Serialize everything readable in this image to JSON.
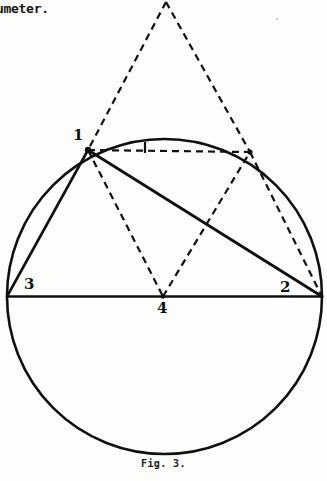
{
  "page": {
    "width": 327,
    "height": 481,
    "background_color": "#fdfdfc",
    "ink_color": "#101010",
    "body_text_fragment": "umeter."
  },
  "figure": {
    "caption": "Fig. 3.",
    "title_implied": "Fig. 3.",
    "stroke_color": "#101010",
    "solid_stroke_width": 2.6,
    "dashed_stroke_width": 2.2,
    "dash_pattern": "7,5",
    "circle": {
      "name": "main-circle",
      "cx": 164.5,
      "cy": 296.5,
      "r": 157.5,
      "style": "solid"
    },
    "diameter": {
      "name": "horizontal-diameter",
      "x1": 7,
      "y1": 296.5,
      "x2": 322,
      "y2": 296.5,
      "style": "solid"
    },
    "points": [
      {
        "id": "1",
        "label": "1",
        "x": 88,
        "y": 150,
        "label_x": 73,
        "label_y": 128
      },
      {
        "id": "2",
        "label": "2",
        "x": 322,
        "y": 296.5,
        "label_x": 280,
        "label_y": 280
      },
      {
        "id": "3",
        "label": "3",
        "x": 7,
        "y": 296.5,
        "label_x": 24,
        "label_y": 277
      },
      {
        "id": "4",
        "label": "4",
        "x": 163,
        "y": 296.5,
        "label_x": 157,
        "label_y": 301
      },
      {
        "id": "apex",
        "label": "",
        "x": 166,
        "y": 2,
        "label_x": 0,
        "label_y": 0
      },
      {
        "id": "mirror",
        "label": "",
        "x": 250,
        "y": 152,
        "label_x": 0,
        "label_y": 0
      }
    ],
    "solid_lines": [
      {
        "name": "chord-1-3",
        "x1": 88,
        "y1": 150,
        "x2": 7,
        "y2": 296.5
      },
      {
        "name": "chord-1-2",
        "x1": 88,
        "y1": 150,
        "x2": 322,
        "y2": 296.5
      }
    ],
    "dashed_lines": [
      {
        "name": "apex-to-point-1",
        "x1": 166,
        "y1": 2,
        "x2": 88,
        "y2": 150
      },
      {
        "name": "apex-to-mirror-point",
        "x1": 166,
        "y1": 2,
        "x2": 250,
        "y2": 152
      },
      {
        "name": "chord-1-to-mirror",
        "x1": 88,
        "y1": 150,
        "x2": 250,
        "y2": 152
      },
      {
        "name": "chord-1-to-4",
        "x1": 88,
        "y1": 150,
        "x2": 163,
        "y2": 296.5
      },
      {
        "name": "chord-4-to-mirror",
        "x1": 163,
        "y1": 296.5,
        "x2": 250,
        "y2": 152
      },
      {
        "name": "chord-mirror-to-2",
        "x1": 250,
        "y1": 152,
        "x2": 322,
        "y2": 296.5
      }
    ],
    "tick_mark": {
      "name": "midpoint-tick",
      "x1": 145,
      "y1": 142,
      "x2": 145,
      "y2": 153
    }
  }
}
